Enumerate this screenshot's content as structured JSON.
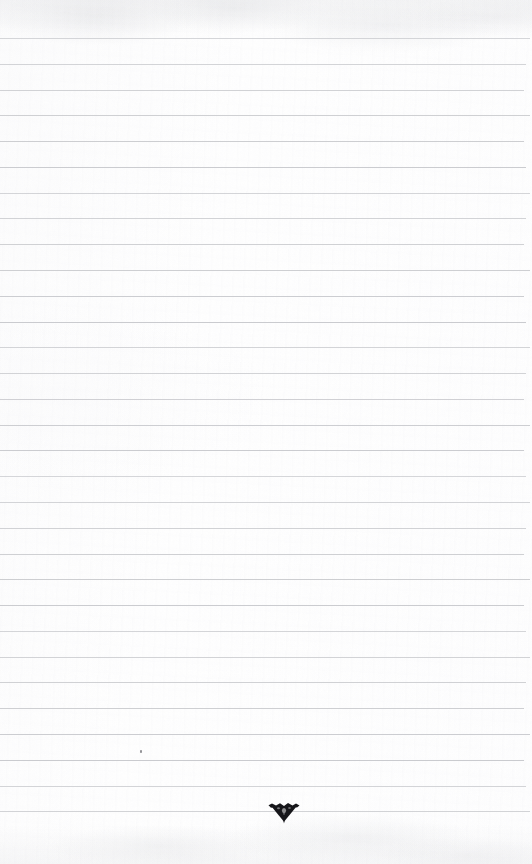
{
  "document": {
    "kind": "scanned-ruled-paper",
    "title": "Blank ruled notebook page",
    "page_width": 532,
    "page_height": 864,
    "background_color": "#fefefe",
    "has_text_content": false,
    "visible_text": ""
  },
  "ruling": {
    "line_color": "#c9cace",
    "line_count": 31,
    "first_line_y": 38,
    "line_spacing": 25.8,
    "line_thickness": 1,
    "line_left_x": 0,
    "line_right_x": 524,
    "has_vertical_margin_rule": false,
    "y_positions": [
      38,
      64,
      90,
      115,
      141,
      167,
      193,
      218,
      244,
      270,
      296,
      322,
      347,
      373,
      399,
      425,
      450,
      476,
      502,
      528,
      554,
      579,
      605,
      631,
      657,
      682,
      708,
      734,
      760,
      786,
      811
    ]
  },
  "marks": [
    {
      "name": "ink-triangle-mark",
      "description": "dark inverted triangular ink mark on the last ruled line",
      "color": "#16161a",
      "x": 267,
      "y": 802,
      "width": 34,
      "height": 22
    },
    {
      "name": "ink-speck",
      "description": "tiny faint pencil speck above the lower ruled lines",
      "color": "#6f6f74",
      "x": 140,
      "y": 750,
      "width": 2,
      "height": 3
    }
  ]
}
